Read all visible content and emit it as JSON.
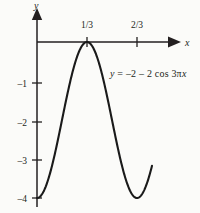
{
  "figure": {
    "background_color": "#fbfbf9",
    "ink_color": "#231f20"
  },
  "axes": {
    "x_axis_label": "x",
    "y_axis_label": "y",
    "x_ticks": [
      {
        "value": "1/3",
        "label": "1/3"
      },
      {
        "value": "2/3",
        "label": "2/3"
      }
    ],
    "y_ticks": [
      {
        "value": -1,
        "label": "–1"
      },
      {
        "value": -2,
        "label": "–2"
      },
      {
        "value": -3,
        "label": "–3"
      },
      {
        "value": -4,
        "label": "–4"
      }
    ],
    "xlim": [
      0,
      0.78
    ],
    "ylim": [
      -4.2,
      0.25
    ],
    "grid": false,
    "origin_px": {
      "x": 37,
      "y": 42
    },
    "unit_px": {
      "x": 150,
      "y": 39
    }
  },
  "equation": {
    "lhs": "y",
    "equals": " = ",
    "rhs": "–2 – 2 cos 3π",
    "rhs_var": "x",
    "full": "y = –2 – 2 cos 3πx"
  },
  "chart_data": {
    "type": "line",
    "title": "",
    "subtitle": "",
    "xlabel": "x",
    "ylabel": "y",
    "xlim": [
      0,
      0.78
    ],
    "ylim": [
      -4.2,
      0.25
    ],
    "grid": false,
    "legend_position": "none",
    "annotations": [
      {
        "text": "y = –2 – 2 cos 3πx",
        "x": 0.48,
        "y": -1.0
      }
    ],
    "xtick_labels": [
      "1/3",
      "2/3"
    ],
    "xtick_values": [
      0.3333,
      0.6667
    ],
    "ytick_labels": [
      "–1",
      "–2",
      "–3",
      "–4"
    ],
    "ytick_values": [
      -1,
      -2,
      -3,
      -4
    ],
    "series": [
      {
        "name": "y = -2 - 2 cos 3πx",
        "formula": "y = -2 - 2*cos(3*pi*x)",
        "x": [
          0.0,
          0.0333,
          0.0667,
          0.1,
          0.1333,
          0.1667,
          0.2,
          0.2333,
          0.2667,
          0.3,
          0.3333,
          0.3667,
          0.4,
          0.4333,
          0.4667,
          0.5,
          0.5333,
          0.5667,
          0.6,
          0.6333,
          0.6667,
          0.7,
          0.7333,
          0.7667
        ],
        "values": [
          -4.0,
          -3.95,
          -3.81,
          -3.58,
          -3.27,
          -2.9,
          -2.5,
          -2.1,
          -1.73,
          -1.42,
          -1.19,
          -1.05,
          -1.0,
          -1.05,
          -1.19,
          -1.42,
          -1.73,
          -2.1,
          -2.5,
          -2.9,
          -3.27,
          -3.58,
          -3.81,
          -3.95
        ]
      }
    ],
    "note_curve_peak": {
      "x": 0.3333,
      "y": 0.0,
      "reading": "curve peak touches x-axis at x = 1/3"
    },
    "note_curve_min": {
      "x": 0.0,
      "y": -4.0,
      "reading": "curve minimum at y = -4 at x = 0 and x = 2/3"
    }
  }
}
